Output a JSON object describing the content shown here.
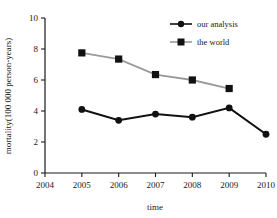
{
  "chart_data": {
    "type": "line",
    "title": "",
    "xlabel": "time",
    "ylabel": "mortality(100 000 person-years)",
    "x": [
      2004,
      2005,
      2006,
      2007,
      2008,
      2009,
      2010
    ],
    "xtick_labels": [
      "2004",
      "2005",
      "2006",
      "2007",
      "2008",
      "2009",
      "2010"
    ],
    "ytick_labels": [
      "0",
      "2",
      "4",
      "6",
      "8",
      "10"
    ],
    "yticks": [
      0,
      2,
      4,
      6,
      8,
      10
    ],
    "xlim": [
      2004,
      2010
    ],
    "ylim": [
      0,
      10
    ],
    "grid": false,
    "legend_position": "top-right",
    "series": [
      {
        "name": "our analysis",
        "marker": "circle",
        "color": "#111111",
        "x": [
          2005,
          2006,
          2007,
          2008,
          2009,
          2010
        ],
        "values": [
          4.1,
          3.4,
          3.8,
          3.6,
          4.2,
          2.5
        ]
      },
      {
        "name": "the world",
        "marker": "square",
        "color": "#9a9a9a",
        "x": [
          2005,
          2006,
          2007,
          2008,
          2009
        ],
        "values": [
          7.75,
          7.35,
          6.35,
          6.0,
          5.45
        ]
      }
    ]
  },
  "axes": {
    "x_title": "time",
    "y_title": "mortality(100 000 person-years)"
  },
  "legend": {
    "items": [
      {
        "label": "our analysis"
      },
      {
        "label": "the world"
      }
    ]
  }
}
